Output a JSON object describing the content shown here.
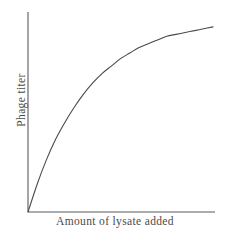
{
  "chart_data": {
    "type": "line",
    "title": "",
    "xlabel": "Amount of lysate added",
    "ylabel": "Phage titer",
    "x_tick_labels": [],
    "y_tick_labels": [],
    "grid": false,
    "legend": null,
    "xlim": [
      0,
      1
    ],
    "ylim": [
      0,
      1
    ],
    "series": [
      {
        "name": "phage titer vs lysate",
        "x": [
          0.0,
          0.05,
          0.1,
          0.15,
          0.2,
          0.25,
          0.3,
          0.35,
          0.4,
          0.45,
          0.5,
          0.55,
          0.6,
          0.65,
          0.7,
          0.75,
          0.8,
          0.85,
          0.9,
          0.95,
          1.0
        ],
        "y": [
          0.0,
          0.15,
          0.28,
          0.39,
          0.48,
          0.56,
          0.63,
          0.69,
          0.74,
          0.78,
          0.82,
          0.85,
          0.88,
          0.9,
          0.92,
          0.94,
          0.95,
          0.96,
          0.97,
          0.98,
          0.99
        ]
      }
    ]
  },
  "style": {
    "line_color": "#4a4a4a",
    "axis_color": "#5a5a5a",
    "background_color": "#ffffff"
  }
}
